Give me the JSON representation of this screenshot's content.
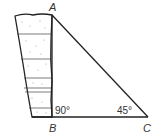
{
  "diagram": {
    "type": "right-triangle-with-cliff",
    "points": {
      "A": {
        "label": "A",
        "x": 52,
        "y": 15
      },
      "B": {
        "label": "B",
        "x": 52,
        "y": 117
      },
      "C": {
        "label": "C",
        "x": 148,
        "y": 117
      }
    },
    "angles": {
      "B": "90°",
      "C": "45°"
    },
    "colors": {
      "line": "#222222",
      "background": "#ffffff",
      "texture": "#888888"
    }
  }
}
